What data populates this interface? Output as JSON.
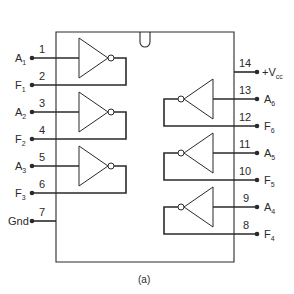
{
  "diagram": {
    "caption": "(a)",
    "colors": {
      "ink": "#2a2a2a",
      "background": "#ffffff"
    },
    "left_pins": [
      {
        "number": "1",
        "name": "A",
        "sub": "1"
      },
      {
        "number": "2",
        "name": "F",
        "sub": "1"
      },
      {
        "number": "3",
        "name": "A",
        "sub": "2"
      },
      {
        "number": "4",
        "name": "F",
        "sub": "2"
      },
      {
        "number": "5",
        "name": "A",
        "sub": "3"
      },
      {
        "number": "6",
        "name": "F",
        "sub": "3"
      },
      {
        "number": "7",
        "name": "Gnd",
        "sub": ""
      }
    ],
    "right_pins": [
      {
        "number": "14",
        "name": "+V",
        "sub": "cc"
      },
      {
        "number": "13",
        "name": "A",
        "sub": "6"
      },
      {
        "number": "12",
        "name": "F",
        "sub": "6"
      },
      {
        "number": "11",
        "name": "A",
        "sub": "5"
      },
      {
        "number": "10",
        "name": "F",
        "sub": "5"
      },
      {
        "number": "9",
        "name": "A",
        "sub": "4"
      },
      {
        "number": "8",
        "name": "F",
        "sub": "4"
      }
    ]
  }
}
